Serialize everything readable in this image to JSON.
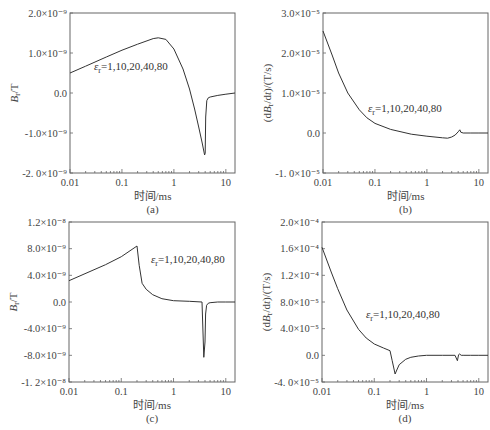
{
  "chart_data": [
    {
      "id": "a",
      "type": "line",
      "panel_label": "(a)",
      "xlabel": "时间/ms",
      "ylabel": "B_r/T",
      "ylabel_main": "B",
      "ylabel_sub": "r",
      "ylabel_unit": "/T",
      "xscale": "log",
      "xlim": [
        0.01,
        15
      ],
      "ylim": [
        -2e-09,
        2e-09
      ],
      "xticks": [
        "0.01",
        "0.1",
        "1",
        "10"
      ],
      "yticks": [
        {
          "value": 2e-09,
          "label": "2.0×10⁻⁹"
        },
        {
          "value": 1e-09,
          "label": "1.0×10⁻⁹"
        },
        {
          "value": 0.0,
          "label": "0.0"
        },
        {
          "value": -1e-09,
          "label": "-1.0×10⁻⁹"
        },
        {
          "value": -2e-09,
          "label": "-2. 0×10⁻⁹"
        }
      ],
      "annotation": {
        "symbol": "ε",
        "sub": "r",
        "text": "=1,10,20,40,80"
      },
      "legend": [],
      "grid": false,
      "series": [
        {
          "name": "εr=1,10,20,40,80",
          "x": [
            0.01,
            0.02,
            0.05,
            0.1,
            0.2,
            0.4,
            0.5,
            0.7,
            1.0,
            1.5,
            2.0,
            2.5,
            3.0,
            3.5,
            3.9,
            4.0,
            4.1,
            4.3,
            4.6,
            5,
            7,
            10,
            15
          ],
          "y": [
            5e-10,
            6.7e-10,
            9e-10,
            1.07e-09,
            1.22e-09,
            1.36e-09,
            1.38e-09,
            1.34e-09,
            1.1e-09,
            6e-10,
            1e-10,
            -4e-10,
            -8.5e-10,
            -1.25e-09,
            -1.55e-09,
            -1.5e-09,
            -6e-10,
            -1.9e-10,
            -1.2e-10,
            -1e-10,
            -6e-11,
            -3e-11,
            0.0
          ]
        }
      ]
    },
    {
      "id": "b",
      "type": "line",
      "panel_label": "(b)",
      "xlabel": "时间/ms",
      "ylabel": "(dB_r/dt)/(T/s)",
      "ylabel_pre": "(d",
      "ylabel_main": "B",
      "ylabel_sub": "r",
      "ylabel_post": "/d",
      "ylabel_t": "t",
      "ylabel_unit": ")/(T/s)",
      "xscale": "log",
      "xlim": [
        0.01,
        15
      ],
      "ylim": [
        -1e-05,
        3e-05
      ],
      "xticks": [
        "0.01",
        "0.1",
        "1",
        "10"
      ],
      "yticks": [
        {
          "value": 3e-05,
          "label": "3.0×10⁻⁵"
        },
        {
          "value": 2e-05,
          "label": "2.0×10⁻⁵"
        },
        {
          "value": 1e-05,
          "label": "1.0×10⁻⁵"
        },
        {
          "value": 0.0,
          "label": "0.0"
        },
        {
          "value": -1e-05,
          "label": "-1. 0×10⁻⁵"
        }
      ],
      "annotation": {
        "symbol": "ε",
        "sub": "r",
        "text": "=1,10,20,40,80"
      },
      "legend": [],
      "grid": false,
      "series": [
        {
          "name": "εr=1,10,20,40,80",
          "x": [
            0.01,
            0.015,
            0.02,
            0.03,
            0.05,
            0.07,
            0.1,
            0.2,
            0.5,
            1.0,
            2.0,
            2.5,
            3.0,
            3.5,
            4.0,
            4.3,
            4.5,
            5,
            7,
            10,
            15
          ],
          "y": [
            2.55e-05,
            1.95e-05,
            1.5e-05,
            1e-05,
            5.8e-06,
            3.8e-06,
            2.4e-06,
            9e-07,
            -3e-07,
            -8e-07,
            -1.2e-06,
            -1.3e-06,
            -1e-06,
            -5e-07,
            3e-07,
            8e-07,
            2e-07,
            0.0,
            0.0,
            0.0,
            0.0
          ]
        }
      ]
    },
    {
      "id": "c",
      "type": "line",
      "panel_label": "(c)",
      "xlabel": "时间/ms",
      "ylabel": "B_r/T",
      "ylabel_main": "B",
      "ylabel_sub": "r",
      "ylabel_unit": "/T",
      "xscale": "log",
      "xlim": [
        0.01,
        15
      ],
      "ylim": [
        -1.2e-08,
        1.2e-08
      ],
      "xticks": [
        "0.01",
        "0.1",
        "1",
        "10"
      ],
      "yticks": [
        {
          "value": 1.2e-08,
          "label": "1.2×10⁻⁸"
        },
        {
          "value": 8e-09,
          "label": "8.0×10⁻⁹"
        },
        {
          "value": 4e-09,
          "label": "4.0×10⁻⁹"
        },
        {
          "value": 0.0,
          "label": "0.0"
        },
        {
          "value": -4e-09,
          "label": "-4.0×10⁻⁹"
        },
        {
          "value": -8e-09,
          "label": "-8.0×10⁻⁹"
        },
        {
          "value": -1.2e-08,
          "label": "-1. 2×10⁻⁸"
        }
      ],
      "annotation": {
        "symbol": "ε",
        "sub": "r",
        "text": "=1,10,20,40,80"
      },
      "legend": [],
      "grid": false,
      "series": [
        {
          "name": "εr=1,10,20,40,80",
          "x": [
            0.01,
            0.05,
            0.1,
            0.2,
            0.22,
            0.25,
            0.3,
            0.4,
            0.6,
            1.0,
            2.0,
            3.5,
            3.8,
            4.0,
            4.1,
            4.3,
            4.6,
            5,
            7,
            10,
            15
          ],
          "y": [
            3.2e-09,
            5.6e-09,
            6.8e-09,
            8.4e-09,
            5.5e-09,
            2.8e-09,
            1.9e-09,
            1.1e-09,
            5e-10,
            2e-10,
            1e-10,
            0.0,
            -8.3e-09,
            -6e-09,
            -1.8e-09,
            -5e-10,
            -2e-10,
            -1e-10,
            0.0,
            0.0,
            0.0
          ]
        }
      ]
    },
    {
      "id": "d",
      "type": "line",
      "panel_label": "(d)",
      "xlabel": "时间/ms",
      "ylabel": "(dB_r/dt)/(T/s)",
      "ylabel_pre": "(d",
      "ylabel_main": "B",
      "ylabel_sub": "r",
      "ylabel_post": "/d",
      "ylabel_t": "t",
      "ylabel_unit": ")/(T/s)",
      "xscale": "log",
      "xlim": [
        0.01,
        15
      ],
      "ylim": [
        -4e-05,
        0.0002
      ],
      "xticks": [
        "0.01",
        "0.1",
        "1",
        "10"
      ],
      "yticks": [
        {
          "value": 0.0002,
          "label": "2.0×10⁻⁴"
        },
        {
          "value": 0.00016,
          "label": "1.6×10⁻⁴"
        },
        {
          "value": 0.00012,
          "label": "1.2×10⁻⁴"
        },
        {
          "value": 8e-05,
          "label": "8.0×10⁻⁵"
        },
        {
          "value": 4e-05,
          "label": "4.0×10⁻⁵"
        },
        {
          "value": 0.0,
          "label": "0.0"
        },
        {
          "value": -4e-05,
          "label": "-4. 0×10⁻⁵"
        }
      ],
      "annotation": {
        "symbol": "ε",
        "sub": "r",
        "text": "=1,10,20,40,80"
      },
      "legend": [],
      "grid": false,
      "series": [
        {
          "name": "εr=1,10,20,40,80",
          "x": [
            0.01,
            0.015,
            0.02,
            0.03,
            0.05,
            0.07,
            0.1,
            0.15,
            0.2,
            0.22,
            0.25,
            0.27,
            0.3,
            0.4,
            0.5,
            0.7,
            1.0,
            2.0,
            3.5,
            3.9,
            4.1,
            4.3,
            4.6,
            5,
            7,
            10,
            15
          ],
          "y": [
            0.000162,
            0.000125,
            0.0001,
            6.8e-05,
            3.9e-05,
            2.6e-05,
            1.7e-05,
            1.1e-05,
            7e-06,
            -8e-06,
            -2.8e-05,
            -2.2e-05,
            -1.4e-05,
            -6e-06,
            -3e-06,
            -1e-06,
            0.0,
            0.0,
            0.0,
            -8e-06,
            1e-06,
            2e-06,
            0.0,
            0.0,
            0.0,
            0.0,
            0.0
          ]
        }
      ]
    }
  ],
  "layout": {
    "panels": {
      "a": {
        "left": 70,
        "top": 13,
        "right": 235,
        "bottom": 173
      },
      "b": {
        "left": 323,
        "top": 13,
        "right": 488,
        "bottom": 173
      },
      "c": {
        "left": 69,
        "top": 222,
        "right": 235,
        "bottom": 382
      },
      "d": {
        "left": 322,
        "top": 222,
        "right": 488,
        "bottom": 382
      }
    },
    "annotation_pos": {
      "a": {
        "x": 94,
        "y": 70
      },
      "b": {
        "x": 368,
        "y": 112
      },
      "c": {
        "x": 151,
        "y": 263
      },
      "d": {
        "x": 366,
        "y": 318
      }
    }
  }
}
